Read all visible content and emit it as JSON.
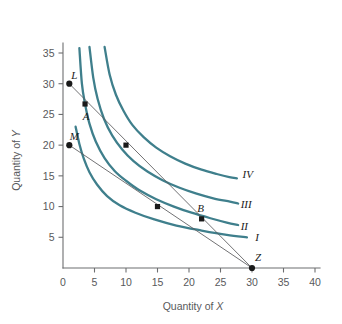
{
  "chart_data": {
    "type": "line",
    "title": "",
    "xlabel_prefix": "Quantity of ",
    "xlabel_italic": "X",
    "ylabel_prefix": "Quantity of ",
    "ylabel_italic": "Y",
    "xlim": [
      0,
      40
    ],
    "ylim": [
      0,
      36
    ],
    "grid": false,
    "legend_position": "inline-right-of-curves",
    "xticks": [
      "0",
      "5",
      "10",
      "15",
      "20",
      "25",
      "30",
      "35",
      "40"
    ],
    "xtick_values": [
      0,
      5,
      10,
      15,
      20,
      25,
      30,
      35,
      40
    ],
    "yticks": [
      "0",
      "5",
      "10",
      "15",
      "20",
      "25",
      "30",
      "35"
    ],
    "ytick_values": [
      0,
      5,
      10,
      15,
      20,
      25,
      30,
      35
    ],
    "accent_color": "#3f7f8c",
    "axis_color": "#6d6e70",
    "marker_color": "#1a1a1a",
    "series": [
      {
        "name": "I",
        "label": "I",
        "label_at": [
          30.5,
          5.0
        ],
        "kind": "indifference-curve",
        "points": [
          [
            2.0,
            23.0
          ],
          [
            2.6,
            20.2
          ],
          [
            3.3,
            17.8
          ],
          [
            4.2,
            15.6
          ],
          [
            5.4,
            13.6
          ],
          [
            7.0,
            11.7
          ],
          [
            9.0,
            10.2
          ],
          [
            11.5,
            9.0
          ],
          [
            14.5,
            7.9
          ],
          [
            18.0,
            6.9
          ],
          [
            22.0,
            6.1
          ],
          [
            26.0,
            5.4
          ],
          [
            29.2,
            5.0
          ]
        ]
      },
      {
        "name": "II",
        "label": "II",
        "label_at": [
          28.2,
          6.8
        ],
        "kind": "indifference-curve",
        "points": [
          [
            2.6,
            35.8
          ],
          [
            3.0,
            30.0
          ],
          [
            3.5,
            26.7
          ],
          [
            4.2,
            23.5
          ],
          [
            5.2,
            20.6
          ],
          [
            6.6,
            17.9
          ],
          [
            8.2,
            15.8
          ],
          [
            10.0,
            14.2
          ],
          [
            12.2,
            12.6
          ],
          [
            14.8,
            11.2
          ],
          [
            17.6,
            10.0
          ],
          [
            20.4,
            9.0
          ],
          [
            23.4,
            8.1
          ],
          [
            26.0,
            7.4
          ],
          [
            27.8,
            7.0
          ]
        ]
      },
      {
        "name": "III",
        "label": "III",
        "label_at": [
          28.2,
          10.4
        ],
        "kind": "indifference-curve",
        "points": [
          [
            4.2,
            36.0
          ],
          [
            4.8,
            31.0
          ],
          [
            5.5,
            27.5
          ],
          [
            6.5,
            24.3
          ],
          [
            7.8,
            21.6
          ],
          [
            9.4,
            19.3
          ],
          [
            11.2,
            17.4
          ],
          [
            13.4,
            15.7
          ],
          [
            15.8,
            14.3
          ],
          [
            18.4,
            13.1
          ],
          [
            21.2,
            12.1
          ],
          [
            24.0,
            11.3
          ],
          [
            26.5,
            10.8
          ],
          [
            27.8,
            10.5
          ]
        ]
      },
      {
        "name": "IV",
        "label": "IV",
        "label_at": [
          28.5,
          15.2
        ],
        "kind": "indifference-curve",
        "points": [
          [
            6.6,
            36.0
          ],
          [
            7.4,
            31.5
          ],
          [
            8.4,
            28.2
          ],
          [
            9.6,
            25.6
          ],
          [
            11.0,
            23.3
          ],
          [
            12.8,
            21.3
          ],
          [
            14.8,
            19.6
          ],
          [
            17.0,
            18.2
          ],
          [
            19.4,
            17.0
          ],
          [
            22.0,
            16.0
          ],
          [
            24.4,
            15.3
          ],
          [
            26.4,
            14.8
          ],
          [
            27.6,
            14.6
          ]
        ]
      }
    ],
    "budget_lines": [
      {
        "name": "LZ",
        "from_label": "L",
        "to_label": "Z",
        "from": [
          1.0,
          30.0
        ],
        "to": [
          30.0,
          0.0
        ]
      },
      {
        "name": "MZ",
        "from_label": "M",
        "to_label": "Z",
        "from": [
          1.0,
          20.0
        ],
        "to": [
          30.0,
          0.0
        ]
      }
    ],
    "labeled_points": [
      {
        "label": "L",
        "x": 1.0,
        "y": 30.0,
        "marker": "circle",
        "label_dx": 5,
        "label_dy": -5
      },
      {
        "label": "M",
        "x": 1.0,
        "y": 20.0,
        "marker": "circle",
        "label_dx": 5,
        "label_dy": -5
      },
      {
        "label": "A",
        "x": 3.5,
        "y": 26.7,
        "marker": "square",
        "label_dx": 1,
        "label_dy": 16
      },
      {
        "label": "B",
        "x": 22.0,
        "y": 8.0,
        "marker": "square",
        "label_dx": -1,
        "label_dy": -7
      },
      {
        "label": "Z",
        "x": 30.0,
        "y": 0.0,
        "marker": "circle",
        "label_dx": 6,
        "label_dy": -7
      }
    ],
    "unlabeled_points": [
      {
        "x": 10.0,
        "y": 20.0,
        "marker": "square"
      },
      {
        "x": 15.0,
        "y": 10.0,
        "marker": "square"
      }
    ]
  }
}
